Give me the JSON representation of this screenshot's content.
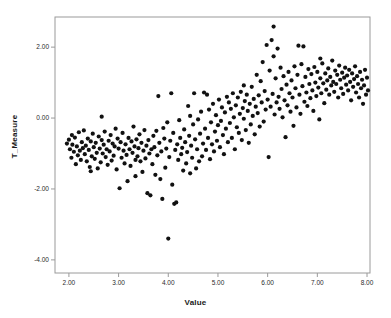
{
  "chart_data": {
    "type": "scatter",
    "title": "",
    "xlabel": "Value",
    "ylabel": "T_Measure",
    "xlim": [
      1.72,
      8.06
    ],
    "ylim": [
      -4.37,
      2.85
    ],
    "xticks": [
      2.0,
      3.0,
      4.0,
      5.0,
      6.0,
      7.0,
      8.0
    ],
    "xticklabels": [
      "2.00",
      "3.00",
      "4.00",
      "5.00",
      "6.00",
      "7.00",
      "8.00"
    ],
    "yticks": [
      2.0,
      0.0,
      -2.0,
      -4.0
    ],
    "yticklabels": [
      "2.00",
      "0.00",
      "-2.00",
      "-4.00"
    ],
    "grid": false,
    "legend": false,
    "marker": {
      "shape": "circle",
      "color": "#111111",
      "size": 2.1
    },
    "frame_color": "#9a9a9a",
    "n_points": 300,
    "trend": "positive linear",
    "points": [
      [
        1.96,
        -0.72
      ],
      [
        2.0,
        -0.61
      ],
      [
        2.02,
        -0.88
      ],
      [
        2.05,
        -1.12
      ],
      [
        2.07,
        -0.75
      ],
      [
        2.1,
        -0.95
      ],
      [
        2.12,
        -0.55
      ],
      [
        2.14,
        -1.3
      ],
      [
        2.16,
        -0.8
      ],
      [
        2.18,
        -1.05
      ],
      [
        2.2,
        -0.4
      ],
      [
        2.22,
        -0.92
      ],
      [
        2.24,
        -1.18
      ],
      [
        2.26,
        -0.68
      ],
      [
        2.28,
        -0.85
      ],
      [
        2.3,
        -0.35
      ],
      [
        2.32,
        -1.02
      ],
      [
        2.34,
        -0.78
      ],
      [
        2.36,
        -1.22
      ],
      [
        2.38,
        -0.58
      ],
      [
        2.4,
        -0.9
      ],
      [
        2.42,
        -1.38
      ],
      [
        2.44,
        -0.66
      ],
      [
        2.46,
        -1.08
      ],
      [
        2.48,
        -0.44
      ],
      [
        2.5,
        -0.82
      ],
      [
        2.52,
        -1.15
      ],
      [
        2.54,
        -0.7
      ],
      [
        2.56,
        -0.98
      ],
      [
        2.58,
        -1.42
      ],
      [
        2.6,
        -0.52
      ],
      [
        2.62,
        -0.86
      ],
      [
        2.64,
        -1.25
      ],
      [
        2.66,
        -0.62
      ],
      [
        2.68,
        -1.0
      ],
      [
        2.7,
        -0.75
      ],
      [
        2.72,
        -0.38
      ],
      [
        2.74,
        -1.1
      ],
      [
        2.76,
        -0.88
      ],
      [
        2.78,
        -1.32
      ],
      [
        2.8,
        -0.64
      ],
      [
        2.82,
        -0.94
      ],
      [
        2.84,
        -0.48
      ],
      [
        2.86,
        -1.2
      ],
      [
        2.88,
        -0.72
      ],
      [
        2.9,
        -1.06
      ],
      [
        2.92,
        -0.8
      ],
      [
        2.94,
        -0.3
      ],
      [
        2.96,
        -1.45
      ],
      [
        2.98,
        -0.58
      ],
      [
        3.0,
        -0.86
      ],
      [
        3.02,
        -1.98
      ],
      [
        3.04,
        -0.68
      ],
      [
        3.06,
        -1.12
      ],
      [
        3.08,
        -0.42
      ],
      [
        3.1,
        -0.92
      ],
      [
        3.12,
        -1.28
      ],
      [
        3.14,
        -0.74
      ],
      [
        3.16,
        -1.04
      ],
      [
        3.18,
        -1.78
      ],
      [
        3.2,
        -0.56
      ],
      [
        3.22,
        -0.88
      ],
      [
        3.24,
        -1.35
      ],
      [
        3.26,
        -0.66
      ],
      [
        3.28,
        -0.98
      ],
      [
        3.3,
        -0.24
      ],
      [
        3.32,
        -0.8
      ],
      [
        3.34,
        -1.18
      ],
      [
        3.36,
        -0.6
      ],
      [
        3.38,
        -1.08
      ],
      [
        3.4,
        -0.85
      ],
      [
        3.42,
        -0.46
      ],
      [
        3.44,
        -1.22
      ],
      [
        3.46,
        -0.7
      ],
      [
        3.48,
        -1.52
      ],
      [
        3.5,
        -0.92
      ],
      [
        3.52,
        -0.34
      ],
      [
        3.54,
        -1.14
      ],
      [
        3.56,
        -0.78
      ],
      [
        3.58,
        -2.12
      ],
      [
        3.6,
        -0.62
      ],
      [
        3.62,
        -1.0
      ],
      [
        3.64,
        -2.18
      ],
      [
        3.66,
        -0.88
      ],
      [
        3.68,
        -1.3
      ],
      [
        3.7,
        -0.5
      ],
      [
        3.72,
        -0.82
      ],
      [
        3.74,
        -1.6
      ],
      [
        3.76,
        -0.36
      ],
      [
        3.78,
        -1.05
      ],
      [
        3.8,
        0.62
      ],
      [
        3.82,
        -0.7
      ],
      [
        3.84,
        -1.72
      ],
      [
        3.86,
        -0.94
      ],
      [
        3.88,
        -2.28
      ],
      [
        3.9,
        -0.28
      ],
      [
        3.92,
        -0.58
      ],
      [
        3.94,
        -1.4
      ],
      [
        3.96,
        -0.86
      ],
      [
        3.98,
        -0.12
      ],
      [
        4.0,
        -3.4
      ],
      [
        4.02,
        -1.1
      ],
      [
        4.04,
        -0.64
      ],
      [
        4.06,
        0.7
      ],
      [
        4.08,
        -1.88
      ],
      [
        4.1,
        -0.42
      ],
      [
        4.12,
        -2.42
      ],
      [
        4.14,
        -0.9
      ],
      [
        4.16,
        -2.38
      ],
      [
        4.18,
        -0.74
      ],
      [
        4.2,
        -1.18
      ],
      [
        4.22,
        -0.06
      ],
      [
        4.24,
        -0.56
      ],
      [
        4.26,
        -1.02
      ],
      [
        4.28,
        -0.84
      ],
      [
        4.3,
        -1.48
      ],
      [
        4.32,
        -0.32
      ],
      [
        4.34,
        -0.68
      ],
      [
        4.36,
        -1.28
      ],
      [
        4.38,
        -0.96
      ],
      [
        4.4,
        0.34
      ],
      [
        4.42,
        -0.5
      ],
      [
        4.44,
        -1.56
      ],
      [
        4.46,
        -0.78
      ],
      [
        4.48,
        -1.12
      ],
      [
        4.5,
        -0.18
      ],
      [
        4.52,
        0.7
      ],
      [
        4.54,
        -0.6
      ],
      [
        4.56,
        -1.42
      ],
      [
        4.58,
        -0.88
      ],
      [
        4.6,
        -0.04
      ],
      [
        4.62,
        -1.22
      ],
      [
        4.64,
        -0.44
      ],
      [
        4.66,
        0.18
      ],
      [
        4.68,
        -1.08
      ],
      [
        4.7,
        -0.72
      ],
      [
        4.72,
        0.72
      ],
      [
        4.74,
        -0.3
      ],
      [
        4.76,
        -0.9
      ],
      [
        4.78,
        0.66
      ],
      [
        4.8,
        -0.56
      ],
      [
        4.82,
        0.24
      ],
      [
        4.84,
        -1.16
      ],
      [
        4.86,
        -0.12
      ],
      [
        4.88,
        -0.74
      ],
      [
        4.9,
        0.4
      ],
      [
        4.92,
        -0.94
      ],
      [
        4.94,
        -0.38
      ],
      [
        4.96,
        0.08
      ],
      [
        4.98,
        -0.64
      ],
      [
        5.0,
        -0.2
      ],
      [
        5.02,
        0.52
      ],
      [
        5.04,
        -0.82
      ],
      [
        5.06,
        -0.08
      ],
      [
        5.08,
        0.3
      ],
      [
        5.1,
        -0.48
      ],
      [
        5.12,
        -1.02
      ],
      [
        5.14,
        0.16
      ],
      [
        5.16,
        -0.3
      ],
      [
        5.18,
        0.6
      ],
      [
        5.2,
        -0.68
      ],
      [
        5.22,
        0.44
      ],
      [
        5.24,
        -0.14
      ],
      [
        5.26,
        0.26
      ],
      [
        5.28,
        -0.56
      ],
      [
        5.3,
        0.7
      ],
      [
        5.32,
        0.02
      ],
      [
        5.34,
        -0.88
      ],
      [
        5.36,
        0.36
      ],
      [
        5.38,
        -0.26
      ],
      [
        5.4,
        0.58
      ],
      [
        5.42,
        -0.42
      ],
      [
        5.44,
        0.12
      ],
      [
        5.46,
        0.74
      ],
      [
        5.48,
        -0.62
      ],
      [
        5.5,
        0.28
      ],
      [
        5.52,
        -0.02
      ],
      [
        5.54,
        0.48
      ],
      [
        5.56,
        -0.34
      ],
      [
        5.58,
        0.66
      ],
      [
        5.6,
        0.2
      ],
      [
        5.62,
        -0.7
      ],
      [
        5.64,
        0.4
      ],
      [
        5.66,
        -0.18
      ],
      [
        5.68,
        0.88
      ],
      [
        5.7,
        0.06
      ],
      [
        5.72,
        0.54
      ],
      [
        5.74,
        -0.46
      ],
      [
        5.76,
        0.32
      ],
      [
        5.78,
        1.22
      ],
      [
        5.8,
        0.14
      ],
      [
        5.82,
        0.64
      ],
      [
        5.84,
        -0.24
      ],
      [
        5.86,
        1.04
      ],
      [
        5.88,
        0.44
      ],
      [
        5.9,
        1.58
      ],
      [
        5.92,
        -0.1
      ],
      [
        5.94,
        0.76
      ],
      [
        5.96,
        0.24
      ],
      [
        5.98,
        2.06
      ],
      [
        6.0,
        0.52
      ],
      [
        6.02,
        -1.1
      ],
      [
        6.04,
        1.34
      ],
      [
        6.06,
        0.32
      ],
      [
        6.08,
        2.2
      ],
      [
        6.1,
        0.68
      ],
      [
        6.12,
        2.58
      ],
      [
        6.14,
        0.1
      ],
      [
        6.16,
        1.12
      ],
      [
        6.18,
        0.44
      ],
      [
        6.2,
        1.96
      ],
      [
        6.22,
        0.6
      ],
      [
        6.24,
        0.26
      ],
      [
        6.26,
        1.42
      ],
      [
        6.28,
        0.82
      ],
      [
        6.3,
        0.02
      ],
      [
        6.32,
        1.18
      ],
      [
        6.34,
        0.5
      ],
      [
        6.36,
        -0.54
      ],
      [
        6.38,
        0.94
      ],
      [
        6.4,
        0.36
      ],
      [
        6.42,
        1.3
      ],
      [
        6.44,
        0.7
      ],
      [
        6.46,
        0.18
      ],
      [
        6.48,
        1.06
      ],
      [
        6.5,
        0.58
      ],
      [
        6.52,
        -0.22
      ],
      [
        6.54,
        1.46
      ],
      [
        6.56,
        0.84
      ],
      [
        6.58,
        0.3
      ],
      [
        6.6,
        1.22
      ],
      [
        6.62,
        2.04
      ],
      [
        6.64,
        0.66
      ],
      [
        6.66,
        0.12
      ],
      [
        6.68,
        1.52
      ],
      [
        6.7,
        0.9
      ],
      [
        6.72,
        2.02
      ],
      [
        6.74,
        0.46
      ],
      [
        6.76,
        1.16
      ],
      [
        6.78,
        0.72
      ],
      [
        6.8,
        0.34
      ],
      [
        6.82,
        1.38
      ],
      [
        6.84,
        0.96
      ],
      [
        6.86,
        0.56
      ],
      [
        6.88,
        1.24
      ],
      [
        6.9,
        0.78
      ],
      [
        6.92,
        0.2
      ],
      [
        6.94,
        1.44
      ],
      [
        6.96,
        1.0
      ],
      [
        6.98,
        0.62
      ],
      [
        7.0,
        1.3
      ],
      [
        7.02,
        0.86
      ],
      [
        7.04,
        -0.04
      ],
      [
        7.06,
        1.12
      ],
      [
        7.08,
        0.7
      ],
      [
        7.1,
        1.54
      ],
      [
        7.12,
        0.98
      ],
      [
        7.14,
        0.42
      ],
      [
        7.16,
        1.26
      ],
      [
        7.18,
        0.8
      ],
      [
        7.2,
        1.06
      ],
      [
        7.22,
        1.4
      ],
      [
        7.24,
        0.66
      ],
      [
        7.26,
        1.16
      ],
      [
        7.28,
        0.92
      ],
      [
        7.3,
        1.62
      ],
      [
        7.32,
        1.02
      ],
      [
        7.34,
        0.74
      ],
      [
        7.36,
        1.34
      ],
      [
        7.38,
        0.96
      ],
      [
        7.4,
        1.22
      ],
      [
        7.42,
        0.58
      ],
      [
        7.44,
        1.48
      ],
      [
        7.46,
        1.08
      ],
      [
        7.48,
        0.84
      ],
      [
        7.5,
        1.28
      ],
      [
        7.52,
        0.68
      ],
      [
        7.54,
        1.14
      ],
      [
        7.56,
        1.42
      ],
      [
        7.58,
        0.94
      ],
      [
        7.6,
        1.2
      ],
      [
        7.62,
        0.78
      ],
      [
        7.64,
        1.36
      ],
      [
        7.66,
        1.02
      ],
      [
        7.68,
        0.5
      ],
      [
        7.7,
        1.26
      ],
      [
        7.72,
        0.88
      ],
      [
        7.74,
        1.1
      ],
      [
        7.76,
        1.46
      ],
      [
        7.78,
        0.72
      ],
      [
        7.8,
        1.18
      ],
      [
        7.82,
        0.96
      ],
      [
        7.84,
        0.58
      ],
      [
        7.86,
        1.3
      ],
      [
        7.88,
        0.84
      ],
      [
        7.9,
        1.08
      ],
      [
        7.92,
        0.4
      ],
      [
        7.94,
        0.92
      ],
      [
        7.96,
        1.36
      ],
      [
        7.98,
        0.66
      ],
      [
        8.0,
        1.14
      ],
      [
        8.02,
        0.78
      ],
      [
        2.06,
        -0.48
      ],
      [
        2.44,
        -1.5
      ],
      [
        3.34,
        -1.64
      ],
      [
        4.44,
        0.06
      ],
      [
        5.52,
        0.92
      ],
      [
        6.12,
        1.74
      ],
      [
        7.06,
        1.68
      ],
      [
        2.66,
        0.04
      ]
    ]
  }
}
